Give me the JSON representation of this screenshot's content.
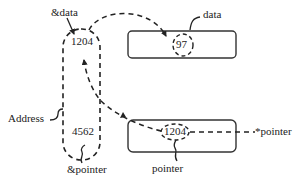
{
  "diagram": {
    "title": "",
    "labels": {
      "amp_data": "&data",
      "data": "data",
      "address": "Address",
      "amp_pointer": "&pointer",
      "pointer": "pointer",
      "deref_pointer": "*pointer"
    },
    "address_column": {
      "top_value": "1204",
      "bottom_value": "4562"
    },
    "data_box": {
      "value": "97"
    },
    "pointer_box": {
      "value": "1204"
    },
    "colors": {
      "stroke": "#222222",
      "background": "#ffffff"
    }
  }
}
